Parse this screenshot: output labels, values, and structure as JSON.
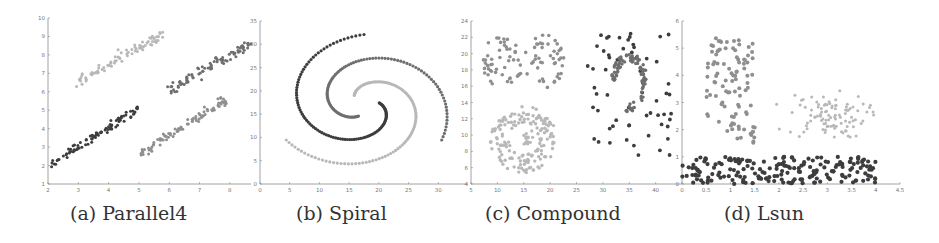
{
  "figure": {
    "captions": [
      "(a) Parallel4",
      "(b) Spiral",
      "(c) Compound",
      "(d) Lsun"
    ]
  },
  "colors": {
    "axis": "#8a8a8a",
    "dark": "#3d3d3d",
    "mid": "#6e6e6e",
    "gray": "#8f8f8f",
    "light": "#b8b8b8"
  },
  "chart_data": [
    {
      "type": "scatter",
      "title": "(a) Parallel4",
      "xlim": [
        2,
        8.7
      ],
      "ylim": [
        1,
        10
      ],
      "xticks": [
        2,
        3,
        4,
        5,
        6,
        7,
        8
      ],
      "yticks": [
        1,
        2,
        3,
        4,
        5,
        6,
        7,
        8,
        9,
        10
      ],
      "series": [
        {
          "name": "cluster-1",
          "shade": "dark",
          "line": {
            "x0": 2.0,
            "y0": 2.0,
            "x1": 5.0,
            "y1": 5.1
          },
          "n": 90
        },
        {
          "name": "cluster-2",
          "shade": "light",
          "line": {
            "x0": 3.0,
            "y0": 6.6,
            "x1": 5.8,
            "y1": 9.1
          },
          "n": 80
        },
        {
          "name": "cluster-3",
          "shade": "mid",
          "line": {
            "x0": 6.0,
            "y0": 6.1,
            "x1": 8.7,
            "y1": 8.6
          },
          "n": 90
        },
        {
          "name": "cluster-4",
          "shade": "gray",
          "line": {
            "x0": 5.0,
            "y0": 2.6,
            "x1": 7.9,
            "y1": 5.6
          },
          "n": 90
        }
      ]
    },
    {
      "type": "scatter",
      "title": "(b) Spiral",
      "xlim": [
        0,
        35
      ],
      "ylim": [
        0,
        35
      ],
      "xticks": [
        0,
        5,
        10,
        15,
        20,
        25,
        30
      ],
      "yticks": [
        0,
        5,
        10,
        15,
        20,
        25,
        30,
        35
      ],
      "series": [
        {
          "name": "spiral-arm-1",
          "shade": "dark",
          "start": [
            18.5,
            19.5
          ],
          "end": [
            19.5,
            31.8
          ],
          "n": 106
        },
        {
          "name": "spiral-arm-2",
          "shade": "mid",
          "start": [
            16,
            14.5
          ],
          "end": [
            4,
            9.5
          ],
          "n": 101
        },
        {
          "name": "spiral-arm-3",
          "shade": "light",
          "start": [
            22,
            15
          ],
          "end": [
            32,
            8
          ],
          "n": 105
        }
      ]
    },
    {
      "type": "scatter",
      "title": "(c) Compound",
      "xlim": [
        5,
        45
      ],
      "ylim": [
        4,
        24
      ],
      "xticks": [
        5,
        10,
        15,
        20,
        25,
        30,
        35,
        40
      ],
      "yticks": [
        4,
        6,
        8,
        10,
        12,
        14,
        16,
        18,
        20,
        22,
        24
      ],
      "series": [
        {
          "name": "blob-left",
          "shade": "gray",
          "center": [
            11,
            19
          ],
          "radius": 3.5,
          "n": 50
        },
        {
          "name": "blob-right",
          "shade": "gray",
          "center": [
            19,
            19
          ],
          "radius": 3.5,
          "n": 45
        },
        {
          "name": "ring",
          "shade": "light",
          "center": [
            15,
            9.5
          ],
          "radius": [
            2.5,
            5.5
          ],
          "n": 158
        },
        {
          "name": "ring-core",
          "shade": "light",
          "center": [
            15.5,
            9.5
          ],
          "radius": 1,
          "n": 16
        },
        {
          "name": "sparse-background",
          "shade": "dark",
          "xrange": [
            27,
            43
          ],
          "yrange": [
            7.5,
            22.5
          ],
          "n": 60
        },
        {
          "name": "crescent",
          "shade": "mid",
          "center": [
            35,
            16.5
          ],
          "n": 92
        }
      ]
    },
    {
      "type": "scatter",
      "title": "(d) Lsun",
      "xlim": [
        0,
        4.5
      ],
      "ylim": [
        0,
        6
      ],
      "xticks": [
        0,
        0.5,
        1,
        1.5,
        2,
        2.5,
        3,
        3.5,
        4,
        4.5
      ],
      "yticks": [
        0,
        1,
        2,
        3,
        4,
        5,
        6
      ],
      "series": [
        {
          "name": "vertical-bar",
          "shade": "gray",
          "xrange": [
            0.5,
            1.5
          ],
          "yrange": [
            1.5,
            5.4
          ],
          "n": 100
        },
        {
          "name": "horizontal-bar",
          "shade": "dark",
          "xrange": [
            0,
            4
          ],
          "yrange": [
            0,
            1
          ],
          "n": 200
        },
        {
          "name": "gaussian-blob",
          "shade": "light",
          "center": [
            3,
            2.5
          ],
          "sd": 0.4,
          "n": 100
        }
      ]
    }
  ]
}
